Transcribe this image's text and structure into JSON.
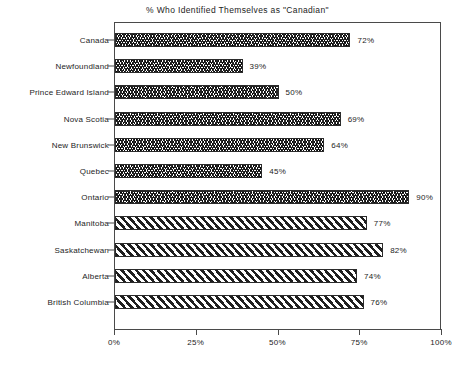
{
  "chart_data": {
    "type": "bar",
    "orientation": "horizontal",
    "title": "% Who Identified Themselves as \"Canadian\"",
    "xlabel": "",
    "ylabel": "",
    "xlim": [
      0,
      100
    ],
    "grid": false,
    "legend": null,
    "xticks": [
      "0%",
      "25%",
      "50%",
      "75%",
      "100%"
    ],
    "xtick_values": [
      0,
      25,
      50,
      75,
      100
    ],
    "categories": [
      "Canada",
      "Newfoundland",
      "Prince Edward Island",
      "Nova Scotia",
      "New Brunswick",
      "Quebec",
      "Ontario",
      "Manitoba",
      "Saskatchewan",
      "Alberta",
      "British Columbia"
    ],
    "values": [
      72,
      39,
      50,
      69,
      64,
      45,
      90,
      77,
      82,
      74,
      76
    ],
    "value_labels": [
      "72%",
      "39%",
      "50%",
      "69%",
      "64%",
      "45%",
      "90%",
      "77%",
      "82%",
      "74%",
      "76%"
    ],
    "bar_fills": [
      "zigzag",
      "zigzag",
      "zigzag",
      "zigzag",
      "zigzag",
      "zigzag",
      "zigzag",
      "diagonal",
      "diagonal",
      "diagonal",
      "diagonal"
    ],
    "colors": {
      "background": "#ffffff",
      "bar_outline": "#2b2b2b",
      "hatch": "#262626",
      "axis": "#4a4a4a",
      "text": "#1d1d1d"
    }
  }
}
